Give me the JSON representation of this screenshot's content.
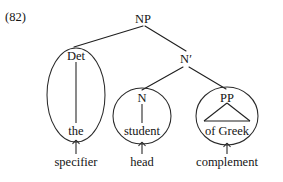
{
  "example": {
    "number": "(82)"
  },
  "diagram": {
    "type": "syntax-tree",
    "stroke_color": "#1f1f1f",
    "background_color": "#ffffff",
    "nodes": [
      {
        "id": "np",
        "label": "NP",
        "x": 143,
        "y": 20,
        "level": 0
      },
      {
        "id": "det",
        "label": "Det",
        "x": 76,
        "y": 57,
        "level": 1
      },
      {
        "id": "nbar",
        "label": "N′",
        "x": 186,
        "y": 60,
        "level": 1
      },
      {
        "id": "n",
        "label": "N",
        "x": 142,
        "y": 99,
        "level": 2
      },
      {
        "id": "pp",
        "label": "PP",
        "x": 227,
        "y": 99,
        "level": 2
      }
    ],
    "terminals": [
      {
        "id": "the",
        "label": "the",
        "x": 76,
        "y": 132,
        "parent": "det"
      },
      {
        "id": "student",
        "label": "student",
        "x": 142,
        "y": 132,
        "parent": "n"
      },
      {
        "id": "of_greek",
        "label": "of Greek",
        "x": 227,
        "y": 132,
        "parent": "pp"
      }
    ],
    "branches": [
      {
        "from": "np",
        "to": "det"
      },
      {
        "from": "np",
        "to": "nbar"
      },
      {
        "from": "nbar",
        "to": "n"
      },
      {
        "from": "nbar",
        "to": "pp"
      }
    ],
    "constituent_circles": [
      {
        "id": "det-ellipse",
        "shape": "ellipse",
        "cx": 76,
        "cy": 95,
        "rx": 29,
        "ry": 47,
        "encloses": "Det + the"
      },
      {
        "id": "n-circle",
        "shape": "circle",
        "cx": 142,
        "cy": 116,
        "rx": 29,
        "ry": 28,
        "encloses": "N + student"
      },
      {
        "id": "pp-circle",
        "shape": "circle",
        "cx": 227,
        "cy": 116,
        "rx": 31,
        "ry": 29,
        "encloses": "PP + of Greek"
      }
    ],
    "triangle": {
      "id": "pp-triangle",
      "apex_x": 227,
      "apex_y": 103,
      "left_x": 204,
      "right_x": 250,
      "base_y": 121
    },
    "role_labels": [
      {
        "id": "specifier",
        "label": "specifier",
        "x": 76,
        "y": 163,
        "points_to": "det-ellipse"
      },
      {
        "id": "head",
        "label": "head",
        "x": 142,
        "y": 163,
        "points_to": "n-circle"
      },
      {
        "id": "complement",
        "label": "complement",
        "x": 227,
        "y": 163,
        "points_to": "pp-circle"
      }
    ],
    "role_arrows": [
      {
        "id": "specifier-arrow",
        "x": 76,
        "y_tail": 154,
        "y_head": 140
      },
      {
        "id": "head-arrow",
        "x": 142,
        "y_tail": 154,
        "y_head": 142
      },
      {
        "id": "complement-arrow",
        "x": 227,
        "y_tail": 154,
        "y_head": 143
      }
    ]
  }
}
